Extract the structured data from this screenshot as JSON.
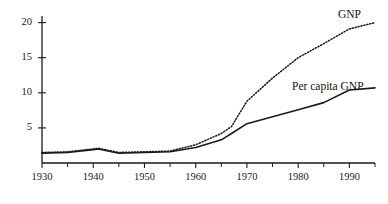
{
  "chart_data": {
    "type": "line",
    "title": "",
    "subtitle": "",
    "xlabel": "",
    "ylabel": "",
    "xlim": [
      1930,
      1995
    ],
    "ylim": [
      0,
      21.5
    ],
    "grid": false,
    "legend_position": "inline-right-of-curves",
    "y_ticks": [
      5,
      10,
      15,
      20
    ],
    "y_tick_labels": [
      "5",
      "10",
      "15",
      "20"
    ],
    "x_ticks": [
      1930,
      1940,
      1950,
      1960,
      1970,
      1980,
      1990
    ],
    "x_tick_labels": [
      "1930",
      "1940",
      "1950",
      "1960",
      "1970",
      "1980",
      "1990"
    ],
    "x_minor_ticks": [
      1935,
      1945,
      1955,
      1965,
      1975,
      1985,
      1995
    ],
    "x": [
      1930,
      1935,
      1940,
      1941,
      1945,
      1950,
      1955,
      1960,
      1965,
      1967,
      1970,
      1975,
      1980,
      1985,
      1990,
      1995
    ],
    "series": [
      {
        "name": "GNP",
        "style": "dotted",
        "color": "#1a1a1a",
        "label": "GNP",
        "values": [
          1.5,
          1.6,
          2.0,
          2.1,
          1.5,
          1.6,
          1.7,
          2.6,
          4.2,
          5.2,
          8.8,
          12.1,
          15.0,
          17.0,
          19.1,
          20.0
        ]
      },
      {
        "name": "Per capita GNP",
        "style": "solid",
        "color": "#1a1a1a",
        "label": "Per capita GNP",
        "values": [
          1.4,
          1.5,
          1.9,
          2.0,
          1.4,
          1.5,
          1.6,
          2.2,
          3.3,
          4.2,
          5.6,
          6.6,
          7.6,
          8.6,
          10.4,
          10.7
        ]
      }
    ],
    "annotations": [
      {
        "text": "GNP",
        "x_px": 338,
        "y_px": 8
      },
      {
        "text": "Per capita GNP",
        "x_px": 292,
        "y_px": 80
      }
    ]
  },
  "axis": {
    "y_axis_name": "value-axis",
    "x_axis_name": "year-axis"
  }
}
